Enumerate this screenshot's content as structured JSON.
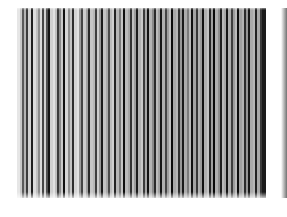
{
  "image": {
    "description": "Photograph of a vertical striped pattern in shades of gray and black on a white background",
    "background": "#ffffff",
    "region": {
      "left": 17,
      "top": 8,
      "width": 270,
      "height": 190
    },
    "stripes": [
      [
        "#e6e6e6",
        3
      ],
      [
        "#c8c8c8",
        2
      ],
      [
        "#5a5a5a",
        2
      ],
      [
        "#b4b4b4",
        2
      ],
      [
        "#3c3c3c",
        2
      ],
      [
        "#d2d2d2",
        3
      ],
      [
        "#1e1e1e",
        2
      ],
      [
        "#dcdcdc",
        3
      ],
      [
        "#c0c0c0",
        2
      ],
      [
        "#8c8c8c",
        2
      ],
      [
        "#dadada",
        2
      ],
      [
        "#464646",
        2
      ],
      [
        "#d0d0d0",
        2
      ],
      [
        "#505050",
        2
      ],
      [
        "#141414",
        2
      ],
      [
        "#cfcfcf",
        3
      ],
      [
        "#e0e0e0",
        2
      ],
      [
        "#bebebe",
        2
      ],
      [
        "#3a3a3a",
        2
      ],
      [
        "#8a8a8a",
        2
      ],
      [
        "#cacaca",
        2
      ],
      [
        "#101010",
        2
      ],
      [
        "#d6d6d6",
        3
      ],
      [
        "#8e8e8e",
        2
      ],
      [
        "#c4c4c4",
        2
      ],
      [
        "#2e2e2e",
        2
      ],
      [
        "#d4d4d4",
        3
      ],
      [
        "#e2e2e2",
        2
      ],
      [
        "#9a9a9a",
        2
      ],
      [
        "#444444",
        2
      ],
      [
        "#cccccc",
        3
      ],
      [
        "#a0a0a0",
        2
      ],
      [
        "#282828",
        2
      ],
      [
        "#c6c6c6",
        3
      ],
      [
        "#b8b8b8",
        2
      ],
      [
        "#3e3e3e",
        2
      ],
      [
        "#cdcdcd",
        2
      ],
      [
        "#969696",
        2
      ],
      [
        "#1a1a1a",
        2
      ],
      [
        "#c2c2c2",
        3
      ],
      [
        "#a8a8a8",
        2
      ],
      [
        "#4a4a4a",
        2
      ],
      [
        "#bcbcbc",
        2
      ],
      [
        "#d0d0d0",
        2
      ],
      [
        "#242424",
        2
      ],
      [
        "#b6b6b6",
        3
      ],
      [
        "#7a7a7a",
        2
      ],
      [
        "#c4c4c4",
        2
      ],
      [
        "#0e0e0e",
        2
      ],
      [
        "#bababa",
        3
      ],
      [
        "#a4a4a4",
        2
      ],
      [
        "#323232",
        2
      ],
      [
        "#c0c0c0",
        2
      ],
      [
        "#9c9c9c",
        2
      ],
      [
        "#1c1c1c",
        2
      ],
      [
        "#b2b2b2",
        3
      ],
      [
        "#c8c8c8",
        2
      ],
      [
        "#3a3a3a",
        2
      ],
      [
        "#a6a6a6",
        2
      ],
      [
        "#121212",
        2
      ],
      [
        "#b4b4b4",
        3
      ],
      [
        "#8a8a8a",
        2
      ],
      [
        "#2a2a2a",
        2
      ],
      [
        "#bcbcbc",
        2
      ],
      [
        "#a2a2a2",
        2
      ],
      [
        "#161616",
        2
      ],
      [
        "#b0b0b0",
        3
      ],
      [
        "#444444",
        2
      ],
      [
        "#9e9e9e",
        2
      ],
      [
        "#c0c0c0",
        2
      ],
      [
        "#0c0c0c",
        2
      ],
      [
        "#a8a8a8",
        3
      ],
      [
        "#b6b6b6",
        2
      ],
      [
        "#303030",
        2
      ],
      [
        "#989898",
        2
      ],
      [
        "#1a1a1a",
        2
      ],
      [
        "#acacac",
        3
      ],
      [
        "#7c7c7c",
        2
      ],
      [
        "#bababa",
        2
      ],
      [
        "#121212",
        2
      ],
      [
        "#a4a4a4",
        3
      ],
      [
        "#383838",
        2
      ],
      [
        "#b2b2b2",
        2
      ],
      [
        "#9a9a9a",
        2
      ],
      [
        "#101010",
        2
      ],
      [
        "#aeaeae",
        3
      ],
      [
        "#c2c2c2",
        2
      ],
      [
        "#262626",
        2
      ],
      [
        "#a0a0a0",
        2
      ],
      [
        "#0a0a0a",
        2
      ],
      [
        "#b0b0b0",
        3
      ],
      [
        "#8e8e8e",
        2
      ],
      [
        "#1e1e1e",
        2
      ],
      [
        "#b8b8b8",
        2
      ],
      [
        "#a6a6a6",
        2
      ],
      [
        "#141414",
        2
      ],
      [
        "#acacac",
        3
      ],
      [
        "#3e3e3e",
        2
      ],
      [
        "#9c9c9c",
        2
      ],
      [
        "#bcbcbc",
        2
      ],
      [
        "#0e0e0e",
        2
      ],
      [
        "#a2a2a2",
        3
      ],
      [
        "#b4b4b4",
        2
      ],
      [
        "#2c2c2c",
        2
      ],
      [
        "#969696",
        2
      ],
      [
        "#181818",
        2
      ],
      [
        "#aaaaaa",
        3
      ],
      [
        "#b6b6b6",
        2
      ],
      [
        "#222222",
        2
      ],
      [
        "#a8a8a8",
        3
      ],
      [
        "#3a3a3a",
        2
      ],
      [
        "#1a1a1a",
        4
      ]
    ]
  }
}
